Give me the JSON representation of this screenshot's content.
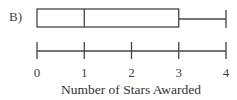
{
  "option_label": "B)",
  "chart_data": {
    "type": "boxplot",
    "title": "",
    "xlabel": "Number of Stars Awarded",
    "ylabel": "",
    "xlim": [
      0,
      4
    ],
    "ticks": [
      0,
      1,
      2,
      3,
      4
    ],
    "tick_labels": [
      "0",
      "1",
      "2",
      "3",
      "4"
    ],
    "grid": false,
    "legend": null,
    "boxplot": {
      "min": 0,
      "q1": 0,
      "median": 1,
      "q3": 3,
      "max": 4
    }
  },
  "colors": {
    "stroke": "#444444",
    "background": "#ffffff"
  }
}
